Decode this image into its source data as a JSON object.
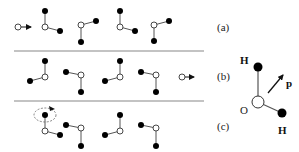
{
  "colors": {
    "background": "#ffffff",
    "atom_fill_h": "#000000",
    "atom_fill_o": "#ffffff",
    "bond": "#555555",
    "separator": "#888888",
    "text": "#222222"
  },
  "panels": [
    {
      "label": "(a)",
      "ion": {
        "x": 18,
        "y": 27,
        "direction": "incoming",
        "arrow_to": [
          31,
          27
        ]
      },
      "molecules": [
        {
          "o": [
            45,
            27
          ],
          "h1": [
            45,
            11
          ],
          "h2": [
            60,
            31
          ]
        },
        {
          "o": [
            81,
            25
          ],
          "h1": [
            96,
            21
          ],
          "h2": [
            81,
            42
          ]
        },
        {
          "o": [
            120,
            27
          ],
          "h1": [
            120,
            11
          ],
          "h2": [
            135,
            31
          ]
        },
        {
          "o": [
            154,
            25
          ],
          "h1": [
            169,
            21
          ],
          "h2": [
            154,
            41
          ]
        }
      ]
    },
    {
      "label": "(b)",
      "ion": {
        "x": 182,
        "y": 77,
        "direction": "outgoing",
        "arrow_to": [
          194,
          77
        ]
      },
      "molecules": [
        {
          "o": [
            45,
            77
          ],
          "h1": [
            45,
            61
          ],
          "h2": [
            30,
            81
          ]
        },
        {
          "o": [
            81,
            75
          ],
          "h1": [
            66,
            72
          ],
          "h2": [
            81,
            92
          ]
        },
        {
          "o": [
            120,
            77
          ],
          "h1": [
            120,
            61
          ],
          "h2": [
            105,
            81
          ]
        },
        {
          "o": [
            156,
            75
          ],
          "h1": [
            141,
            72
          ],
          "h2": [
            156,
            92
          ]
        }
      ]
    },
    {
      "label": "(c)",
      "rotation_marker": {
        "cx": 45,
        "cy": 115,
        "rx": 11,
        "ry": 7
      },
      "molecules": [
        {
          "o": [
            45,
            131
          ],
          "h1": [
            45,
            115
          ],
          "h2": [
            60,
            135
          ]
        },
        {
          "o": [
            81,
            128
          ],
          "h1": [
            66,
            125
          ],
          "h2": [
            81,
            146
          ]
        },
        {
          "o": [
            120,
            131
          ],
          "h1": [
            120,
            115
          ],
          "h2": [
            105,
            135
          ]
        },
        {
          "o": [
            156,
            128
          ],
          "h1": [
            141,
            125
          ],
          "h2": [
            156,
            146
          ]
        }
      ]
    }
  ],
  "separators": [
    {
      "x1": 14,
      "x2": 204,
      "y": 51
    },
    {
      "x1": 14,
      "x2": 204,
      "y": 101
    }
  ],
  "legend": {
    "oxygen_label": "O",
    "hydrogen_label_top": "H",
    "hydrogen_label_bottom": "H",
    "dipole_label": "p",
    "o": [
      258,
      102
    ],
    "h_top": [
      258,
      67
    ],
    "h_bottom": [
      282,
      113
    ]
  }
}
